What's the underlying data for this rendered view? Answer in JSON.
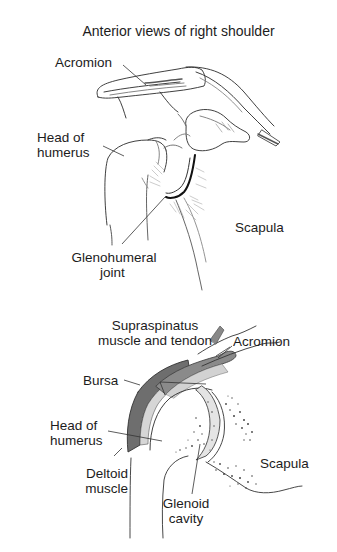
{
  "title": "Anterior views of right shoulder",
  "top_view": {
    "labels": {
      "acromion": "Acromion",
      "head_of_humerus_line1": "Head of",
      "head_of_humerus_line2": "humerus",
      "scapula": "Scapula",
      "glenohumeral_line1": "Glenohumeral",
      "glenohumeral_line2": "joint"
    }
  },
  "bottom_view": {
    "labels": {
      "supraspinatus_line1": "Supraspinatus",
      "supraspinatus_line2": "muscle and tendon",
      "acromion": "Acromion",
      "bursa": "Bursa",
      "head_of_humerus_line1": "Head of",
      "head_of_humerus_line2": "humerus",
      "deltoid_line1": "Deltoid",
      "deltoid_line2": "muscle",
      "scapula": "Scapula",
      "glenoid_line1": "Glenoid",
      "glenoid_line2": "cavity"
    }
  },
  "colors": {
    "background": "#ffffff",
    "ink": "#1c1c1c",
    "deltoid_fill": "#6e6e6e",
    "tendon_fill": "#8a8a8a",
    "bursa_fill": "#d6d6d6",
    "cartilage_fill": "#e4e4e4"
  }
}
